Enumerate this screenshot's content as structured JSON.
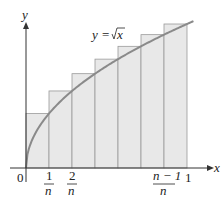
{
  "chart_data": {
    "type": "bar",
    "title": "",
    "function_label": "y = √x",
    "xlabel": "x",
    "ylabel": "y",
    "x_ticks": [
      "0",
      "1/n",
      "2/n",
      "(n−1)/n",
      "1"
    ],
    "categories": [
      "1/7",
      "2/7",
      "3/7",
      "4/7",
      "5/7",
      "6/7",
      "1"
    ],
    "values": [
      0.378,
      0.535,
      0.655,
      0.756,
      0.845,
      0.926,
      1.0
    ],
    "curve": "sqrt",
    "xlim": [
      0,
      1
    ],
    "ylim": [
      0,
      1
    ],
    "grid": false,
    "legend": "none",
    "note": "Upper Riemann sum rectangles under y = sqrt(x) with n = 7 subintervals"
  },
  "labels": {
    "y_axis": "y",
    "x_axis": "x",
    "origin": "0",
    "one": "1",
    "n": "n",
    "tick1_num": "1",
    "tick2_num": "2",
    "tickn1_num": "n − 1",
    "func_y": "y",
    "func_eq": "=",
    "func_x": "x"
  },
  "colors": {
    "rect_fill": "#e8e8e8",
    "rect_stroke": "#9a9a9a",
    "curve": "#8a8a8a",
    "axis": "#333333"
  }
}
